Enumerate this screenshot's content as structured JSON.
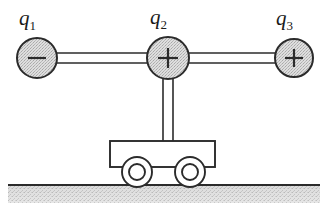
{
  "figure": {
    "type": "physics-free-body-diagram",
    "width": 327,
    "height": 209,
    "background_color": "#ffffff"
  },
  "charges": [
    {
      "id": "q1",
      "label": "q",
      "subscript": "1",
      "sign": "−",
      "sign_name": "minus-sign",
      "polarity": "negative",
      "cx": 37,
      "cy": 58,
      "r": 20,
      "fill": "#d4d4d4",
      "stroke": "#2b2b2b",
      "label_x": 19,
      "label_y": 8
    },
    {
      "id": "q2",
      "label": "q",
      "subscript": "2",
      "sign": "+",
      "sign_name": "plus-sign",
      "polarity": "positive",
      "cx": 168,
      "cy": 58,
      "r": 21,
      "fill": "#d4d4d4",
      "stroke": "#2b2b2b",
      "label_x": 150,
      "label_y": 7
    },
    {
      "id": "q3",
      "label": "q",
      "subscript": "3",
      "sign": "+",
      "sign_name": "plus-sign",
      "polarity": "positive",
      "cx": 294,
      "cy": 58,
      "r": 19,
      "fill": "#d4d4d4",
      "stroke": "#2b2b2b",
      "label_x": 276,
      "label_y": 8
    }
  ],
  "rods": [
    {
      "id": "rod-q1-q2",
      "orientation": "horizontal",
      "x1": 52,
      "x2": 155,
      "y_top": 53,
      "y_bottom": 63
    },
    {
      "id": "rod-q2-q3",
      "orientation": "horizontal",
      "x1": 182,
      "x2": 281,
      "y_top": 53,
      "y_bottom": 63
    },
    {
      "id": "rod-q2-cart",
      "orientation": "vertical",
      "y1": 75,
      "y2": 142,
      "x_left": 163,
      "x_right": 173
    }
  ],
  "cart": {
    "body": {
      "x": 110,
      "y": 141,
      "width": 105,
      "height": 26,
      "fill": "#ffffff",
      "stroke": "#2b2b2b"
    },
    "wheels": [
      {
        "id": "wheel-left",
        "cx": 137,
        "cy": 172,
        "r_outer": 15,
        "r_inner": 8
      },
      {
        "id": "wheel-right",
        "cx": 190,
        "cy": 172,
        "r_outer": 15,
        "r_inner": 8
      }
    ]
  },
  "ground": {
    "line_y": 185,
    "x_start": 8,
    "x_end": 320,
    "band_height": 17,
    "line_color": "#2b2b2b",
    "fill_color": "#d9d9d9"
  },
  "colors": {
    "stroke": "#2b2b2b",
    "charge_fill": "#d4d4d4",
    "ground_fill": "#d9d9d9",
    "background": "#ffffff"
  }
}
